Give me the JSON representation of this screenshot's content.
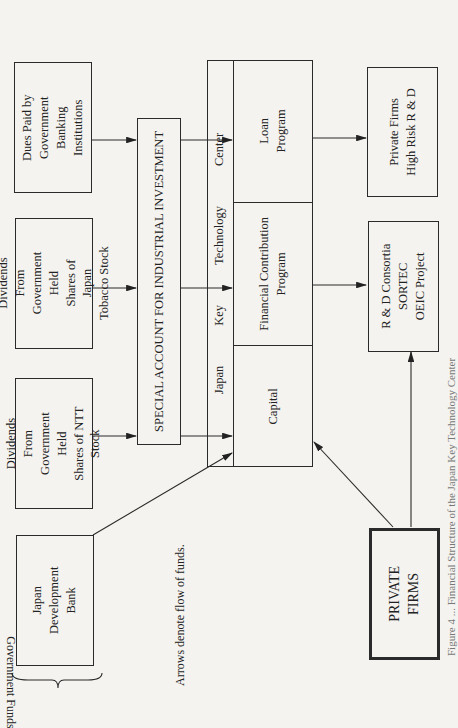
{
  "diagram": {
    "group_label": "Government Funds",
    "note": "Arrows denote flow of funds.",
    "sources": [
      {
        "id": "dues",
        "label": "Dues Paid by\nGovernment Banking\nInstitutions"
      },
      {
        "id": "jt",
        "label": "Dividends From\nGovernment Held\nShares of Japan\nTobacco Stock"
      },
      {
        "id": "ntt",
        "label": "Dividends From\nGovernment Held\nShares of NTT Stock"
      },
      {
        "id": "jdb",
        "label": "Japan\nDevelopment\nBank"
      }
    ],
    "special_account": "SPECIAL ACCOUNT FOR INDUSTRIAL INVESTMENT",
    "center": {
      "title_words": [
        "Japan",
        "Key",
        "Technology",
        "Center"
      ],
      "sections": [
        {
          "id": "loan",
          "label": "Loan\nProgram"
        },
        {
          "id": "fcp",
          "label": "Financial Contribution\nProgram"
        },
        {
          "id": "capital",
          "label": "Capital"
        }
      ]
    },
    "recipients": [
      {
        "id": "highrisk",
        "label": "Private Firms\nHigh Risk R & D"
      },
      {
        "id": "consortia",
        "label": "R & D Consortia\nSORTEC\nOEIC Project"
      }
    ],
    "private_firms": "PRIVATE\nFIRMS",
    "edges": [
      {
        "from": "Dues Paid by Government Banking Institutions",
        "to": "Special Account"
      },
      {
        "from": "Dividends (Japan Tobacco)",
        "to": "Special Account"
      },
      {
        "from": "Dividends (NTT)",
        "to": "Special Account"
      },
      {
        "from": "Special Account",
        "to": "Loan Program"
      },
      {
        "from": "Special Account",
        "to": "Financial Contribution Program"
      },
      {
        "from": "Special Account",
        "to": "Capital"
      },
      {
        "from": "Japan Development Bank",
        "to": "Capital"
      },
      {
        "from": "Private Firms",
        "to": "Capital"
      },
      {
        "from": "Private Firms",
        "to": "R & D Consortia"
      },
      {
        "from": "Loan Program",
        "to": "Private Firms High Risk R & D"
      },
      {
        "from": "Financial Contribution Program",
        "to": "R & D Consortia"
      }
    ],
    "caption_partial": "Figure 4 ... Financial Structure of the Japan Key Technology Center"
  }
}
